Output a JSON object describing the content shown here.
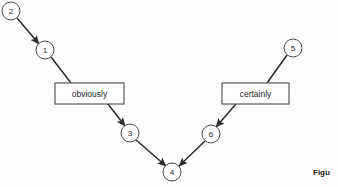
{
  "figure": {
    "background_color": "#fefefe",
    "stroke_color": "#2a2a2a",
    "node_stroke_color": "#4a4a4a",
    "box_stroke_color": "#595959",
    "caption": "Figu",
    "caption_left": 313,
    "caption_top": 168
  },
  "nodes": [
    {
      "id": "node-2",
      "label": "2",
      "cx": 11,
      "cy": 11,
      "r": 9
    },
    {
      "id": "node-1",
      "label": "1",
      "cx": 45,
      "cy": 50,
      "r": 9
    },
    {
      "id": "node-3",
      "label": "3",
      "cx": 130,
      "cy": 133,
      "r": 9
    },
    {
      "id": "node-4",
      "label": "4",
      "cx": 172,
      "cy": 172,
      "r": 9
    },
    {
      "id": "node-6",
      "label": "6",
      "cx": 211,
      "cy": 134,
      "r": 9
    },
    {
      "id": "node-5",
      "label": "5",
      "cx": 293,
      "cy": 48,
      "r": 9
    }
  ],
  "boxes": [
    {
      "id": "box-obviously",
      "label": "obviously",
      "x": 55,
      "y": 83,
      "width": 69,
      "height": 21
    },
    {
      "id": "box-certainly",
      "label": "certainly",
      "x": 222,
      "y": 83,
      "width": 67,
      "height": 21
    }
  ],
  "edges": [
    {
      "id": "edge-2-to-1",
      "from": "node-2",
      "to": "node-1",
      "x1": 17,
      "y1": 18,
      "x2": 39,
      "y2": 44,
      "arrow": true
    },
    {
      "id": "edge-1-to-obviously",
      "from": "node-1",
      "to": "box-obviously",
      "x1": 51,
      "y1": 57,
      "x2": 71,
      "y2": 83,
      "arrow": false
    },
    {
      "id": "edge-obviously-to-3",
      "from": "box-obviously",
      "to": "node-3",
      "x1": 108,
      "y1": 104,
      "x2": 125,
      "y2": 126,
      "arrow": true
    },
    {
      "id": "edge-3-to-4",
      "from": "node-3",
      "to": "node-4",
      "x1": 136,
      "y1": 140,
      "x2": 166,
      "y2": 166,
      "arrow": true
    },
    {
      "id": "edge-6-to-4",
      "from": "node-6",
      "to": "node-4",
      "x1": 205,
      "y1": 141,
      "x2": 179,
      "y2": 166,
      "arrow": true
    },
    {
      "id": "edge-certainly-to-6",
      "from": "box-certainly",
      "to": "node-6",
      "x1": 236,
      "y1": 104,
      "x2": 216,
      "y2": 127,
      "arrow": true
    },
    {
      "id": "edge-5-to-certainly",
      "from": "node-5",
      "to": "box-certainly",
      "x1": 287,
      "y1": 55,
      "x2": 267,
      "y2": 83,
      "arrow": false
    }
  ]
}
